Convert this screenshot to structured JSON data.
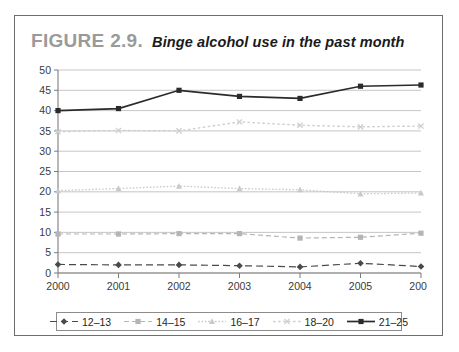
{
  "figure": {
    "number": "FIGURE 2.9.",
    "title": "Binge alcohol use in the past month"
  },
  "chart_data": {
    "type": "line",
    "title": "Binge alcohol use in the past month",
    "xlabel": "",
    "ylabel": "",
    "categories": [
      "2000",
      "2001",
      "2002",
      "2003",
      "2004",
      "2005",
      "2006"
    ],
    "x": [
      2000,
      2001,
      2002,
      2003,
      2004,
      2005,
      2006
    ],
    "ylim": [
      0,
      50
    ],
    "yticks": [
      0,
      5,
      10,
      15,
      20,
      25,
      30,
      35,
      40,
      45,
      50
    ],
    "grid": true,
    "legend_position": "bottom",
    "series": [
      {
        "name": "12–13",
        "values": [
          2.1,
          2.0,
          2.0,
          1.8,
          1.5,
          2.4,
          1.6
        ],
        "color": "#4a4a4a",
        "marker": "diamond",
        "dash": "7,4",
        "width": 1.2
      },
      {
        "name": "14–15",
        "values": [
          9.6,
          9.6,
          9.7,
          9.7,
          8.6,
          8.8,
          9.8
        ],
        "color": "#b5b5b5",
        "marker": "square",
        "dash": "5,3",
        "width": 1.2
      },
      {
        "name": "16–17",
        "values": [
          20.3,
          20.8,
          21.4,
          20.8,
          20.5,
          19.5,
          19.7
        ],
        "color": "#c9c9c9",
        "marker": "triangle",
        "dash": "1.6,1.8",
        "width": 1.3
      },
      {
        "name": "18–20",
        "values": [
          34.8,
          35.1,
          35.0,
          37.2,
          36.4,
          36.0,
          36.2
        ],
        "color": "#cfcfcf",
        "marker": "x",
        "dash": "2.6,2.4",
        "width": 1.4
      },
      {
        "name": "21–25",
        "values": [
          40.0,
          40.5,
          45.0,
          43.5,
          43.0,
          46.0,
          46.3
        ],
        "color": "#2b2b2b",
        "marker": "square",
        "dash": "",
        "width": 1.7
      }
    ]
  },
  "legend": {
    "items": [
      {
        "label": "12–13"
      },
      {
        "label": "14–15"
      },
      {
        "label": "16–17"
      },
      {
        "label": "18–20"
      },
      {
        "label": "21–25"
      }
    ]
  }
}
